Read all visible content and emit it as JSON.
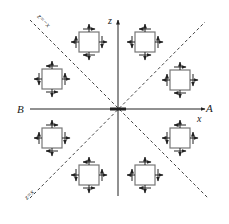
{
  "diagram": {
    "axes": {
      "horizontal_label": "x",
      "vertical_label": "z",
      "right_point_label": "A",
      "left_point_label": "B"
    },
    "diagonals": [
      {
        "id": "diag-neg",
        "label": "z=−x"
      },
      {
        "id": "diag-pos",
        "label": "z=x"
      }
    ],
    "stress_elements": [
      {
        "id": "el-upper-left",
        "quadrant": "II",
        "shear": "cw"
      },
      {
        "id": "el-upper-right",
        "quadrant": "I",
        "shear": "ccw"
      },
      {
        "id": "el-left-upper",
        "quadrant": "II",
        "shear": "ccw"
      },
      {
        "id": "el-right-upper",
        "quadrant": "I",
        "shear": "cw"
      },
      {
        "id": "el-left-lower",
        "quadrant": "III",
        "shear": "cw"
      },
      {
        "id": "el-right-lower",
        "quadrant": "IV",
        "shear": "ccw"
      },
      {
        "id": "el-lower-left",
        "quadrant": "III",
        "shear": "ccw"
      },
      {
        "id": "el-lower-right",
        "quadrant": "IV",
        "shear": "cw"
      }
    ],
    "colors": {
      "line": "#222222",
      "square": "#777777"
    }
  }
}
